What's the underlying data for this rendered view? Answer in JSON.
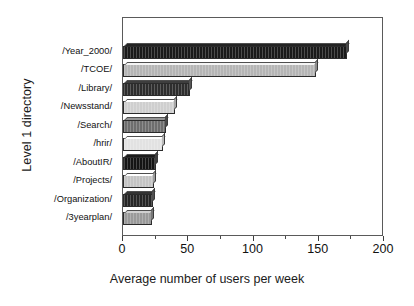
{
  "chart_data": {
    "type": "bar",
    "orientation": "horizontal",
    "title": "",
    "xlabel": "Average number of users per week",
    "ylabel": "Level 1 directory",
    "categories": [
      "/Year_2000/",
      "/TCOE/",
      "/Library/",
      "/Newsstand/",
      "/Search/",
      "/hrir/",
      "/AboutIR/",
      "/Projects/",
      "/Organization/",
      "/3yearplan/"
    ],
    "values": [
      172,
      148,
      51,
      40,
      33,
      31,
      25,
      24,
      23,
      22
    ],
    "xlim": [
      0,
      200
    ],
    "xticks": [
      0,
      50,
      100,
      150,
      200
    ],
    "xtick_labels": [
      "0",
      "50",
      "100",
      "150",
      "200"
    ],
    "xminor_ticks": [
      25,
      75,
      125,
      175
    ],
    "grid": false,
    "legend": null,
    "bar_colors": [
      "#1a1a1a",
      "#b5b5b5",
      "#2e2e2e",
      "#cfcfcf",
      "#6e6e6e",
      "#e2e2e2",
      "#141414",
      "#c4c4c4",
      "#262626",
      "#9a9a9a"
    ],
    "bar_side_colors": [
      "#4a4a4a",
      "#8e8e8e",
      "#565656",
      "#a6a6a6",
      "#494949",
      "#b8b8b8",
      "#3f3f3f",
      "#9c9c9c",
      "#505050",
      "#777777"
    ],
    "frame_color": "#5a5a5a",
    "background": "#ffffff",
    "text_color": "#111111"
  }
}
